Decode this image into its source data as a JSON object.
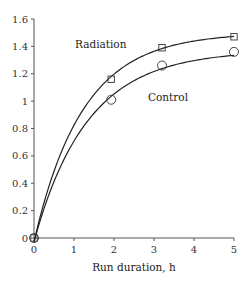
{
  "chart_data": {
    "type": "line",
    "title": "",
    "xlabel": "Run duration, h",
    "ylabel": "",
    "xlim": [
      0,
      5
    ],
    "ylim": [
      0,
      1.6
    ],
    "x_ticks": [
      "0",
      "1",
      "2",
      "3",
      "4",
      "5"
    ],
    "y_ticks": [
      "0",
      "0.2",
      "0.4",
      "0.6",
      "0.8",
      "1",
      "1.2",
      "1.4",
      "1.6"
    ],
    "grid": false,
    "legend": "inline labels",
    "series": [
      {
        "name": "Radiation",
        "marker": "square",
        "points": [
          {
            "x": 0,
            "y": 0
          },
          {
            "x": 1.93,
            "y": 1.16
          },
          {
            "x": 3.2,
            "y": 1.39
          },
          {
            "x": 5,
            "y": 1.47
          }
        ],
        "fit": {
          "a": 1.5,
          "k": 0.8
        }
      },
      {
        "name": "Control",
        "marker": "circle",
        "points": [
          {
            "x": 0,
            "y": 0
          },
          {
            "x": 1.93,
            "y": 1.01
          },
          {
            "x": 3.2,
            "y": 1.26
          },
          {
            "x": 5,
            "y": 1.36
          }
        ],
        "fit": {
          "a": 1.37,
          "k": 0.73
        }
      }
    ]
  },
  "labels": {
    "radiation": "Radiation",
    "control": "Control",
    "xlabel": "Run duration, h"
  }
}
